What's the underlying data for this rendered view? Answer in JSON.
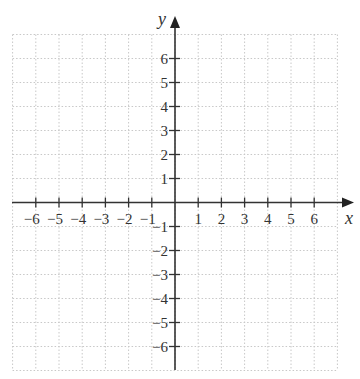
{
  "diagram": {
    "type": "coordinate-plane",
    "x_axis": {
      "label": "x",
      "ticks": [
        "−6",
        "−5",
        "−4",
        "−3",
        "−2",
        "−1",
        "1",
        "2",
        "3",
        "4",
        "5",
        "6"
      ],
      "range": [
        -7,
        7
      ]
    },
    "y_axis": {
      "label": "y",
      "ticks_positive": [
        "1",
        "2",
        "3",
        "4",
        "5",
        "6"
      ],
      "ticks_negative": [
        "−1",
        "−2",
        "−3",
        "−4",
        "−5",
        "−6"
      ],
      "range": [
        -7,
        7
      ]
    },
    "grid": {
      "visible": true,
      "style": "dotted",
      "color": "#c8c8c8"
    },
    "axis_color": "#333333"
  }
}
